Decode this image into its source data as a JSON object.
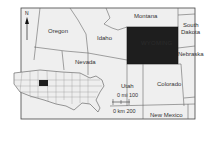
{
  "map": {
    "highlight_state": "Wyoming",
    "colors": {
      "background": "#ffffff",
      "land": "#efefef",
      "border": "#555555",
      "highlight": "#1e1e1e",
      "frame": "#444444"
    },
    "north_arrow": {
      "label": "N"
    },
    "states": [
      {
        "name": "Oregon"
      },
      {
        "name": "Idaho"
      },
      {
        "name": "Montana"
      },
      {
        "name": "South Dakota",
        "line1": "South",
        "line2": "Dakota"
      },
      {
        "name": "Nebraska"
      },
      {
        "name": "Nevada"
      },
      {
        "name": "Utah"
      },
      {
        "name": "Colorado"
      },
      {
        "name": "New Mexico"
      }
    ],
    "highlight_labels": [
      "WYOMING"
    ],
    "scale_bar": {
      "miles_label": "0 mi 100",
      "km_label": "0 km 200"
    },
    "inset": {
      "description": "USA locator map with Wyoming highlighted"
    }
  }
}
